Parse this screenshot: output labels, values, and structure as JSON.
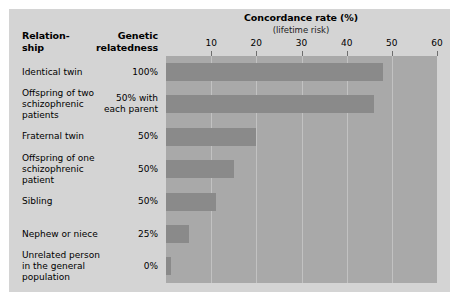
{
  "table": {
    "header_relationship": "Relation-\nship",
    "header_genetic": "Genetic\nrelatedness"
  },
  "chart_data": {
    "type": "bar",
    "orientation": "horizontal",
    "title": "Concordance rate (%)",
    "subtitle": "(lifetime risk)",
    "xlabel": "Concordance rate (%)",
    "ylabel": "",
    "xlim": [
      0,
      60
    ],
    "xticks": [
      10,
      20,
      30,
      40,
      50,
      60
    ],
    "xtick_labels": [
      "10",
      "20",
      "30",
      "40",
      "50",
      "60"
    ],
    "grid": true,
    "legend": "none",
    "categories": [
      "Identical twin",
      "Offspring of two schizophrenic patients",
      "Fraternal twin",
      "Offspring of one schizophrenic patient",
      "Sibling",
      "Nephew or niece",
      "Unrelated person in the general population"
    ],
    "category_lines": [
      [
        "Identical twin"
      ],
      [
        "Offspring of two",
        "schizophrenic",
        "patients"
      ],
      [
        "Fraternal twin"
      ],
      [
        "Offspring of one",
        "schizophrenic",
        "patient"
      ],
      [
        "Sibling"
      ],
      [
        "Nephew or niece"
      ],
      [
        "Unrelated person",
        "in the general",
        "population"
      ]
    ],
    "genetic_relatedness": [
      "100%",
      "50% with\neach parent",
      "50%",
      "50%",
      "50%",
      "25%",
      "0%"
    ],
    "genetic_relatedness_lines": [
      [
        "100%"
      ],
      [
        "50% with",
        "each parent"
      ],
      [
        "50%"
      ],
      [
        "50%"
      ],
      [
        "50%"
      ],
      [
        "25%"
      ],
      [
        "0%"
      ]
    ],
    "values": [
      48,
      46,
      20,
      15,
      11,
      5,
      1
    ],
    "colors": {
      "bar": "#8a8a8a",
      "plot_background": "#a9a9a9",
      "panel_background": "#d4d4d4",
      "gridline": "#c2c2c2",
      "figure_background": "#ffffff",
      "text": "#000000"
    }
  }
}
